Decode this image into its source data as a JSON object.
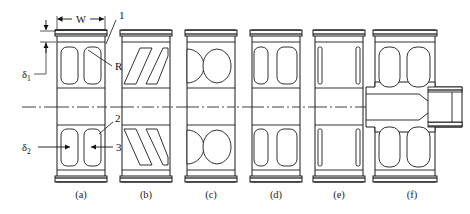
{
  "figure": {
    "kind": "engineering-elevation-drawing",
    "background_color": "#ffffff",
    "line_color": "#1b1b1b",
    "centerline_color": "#2b2b2b",
    "hatch_color": "#4a4a4a"
  },
  "captions": [
    {
      "id": "a",
      "text": "(a)"
    },
    {
      "id": "b",
      "text": "(b)"
    },
    {
      "id": "c",
      "text": "(c)"
    },
    {
      "id": "d",
      "text": "(d)"
    },
    {
      "id": "e",
      "text": "(e)"
    },
    {
      "id": "f",
      "text": "(f)"
    }
  ],
  "dimensions": {
    "width_label": "W",
    "delta1": {
      "symbol": "δ",
      "subscript": "1"
    },
    "delta2": {
      "symbol": "δ",
      "subscript": "2"
    }
  },
  "callouts": [
    {
      "id": "1",
      "text": "1"
    },
    {
      "id": "R",
      "text": "R"
    },
    {
      "id": "2",
      "text": "2"
    },
    {
      "id": "3",
      "text": "3"
    }
  ]
}
